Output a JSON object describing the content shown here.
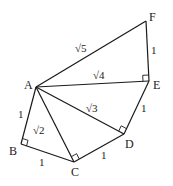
{
  "diagram": {
    "points": {
      "A": {
        "label": "A",
        "x": 36,
        "y": 87
      },
      "B": {
        "label": "B",
        "x": 21,
        "y": 144
      },
      "C": {
        "label": "C",
        "x": 74,
        "y": 162
      },
      "D": {
        "label": "D",
        "x": 124,
        "y": 134
      },
      "E": {
        "label": "E",
        "x": 149,
        "y": 81
      },
      "F": {
        "label": "F",
        "x": 146,
        "y": 21
      }
    },
    "segments": [
      {
        "from": "A",
        "to": "B",
        "length": "1"
      },
      {
        "from": "B",
        "to": "C",
        "length": "1"
      },
      {
        "from": "A",
        "to": "C",
        "length": "√2"
      },
      {
        "from": "C",
        "to": "D",
        "length": "1"
      },
      {
        "from": "A",
        "to": "D",
        "length": "√3"
      },
      {
        "from": "D",
        "to": "E",
        "length": "1"
      },
      {
        "from": "A",
        "to": "E",
        "length": "√4"
      },
      {
        "from": "E",
        "to": "F",
        "length": "1"
      },
      {
        "from": "A",
        "to": "F",
        "length": "√5"
      }
    ],
    "right_angles": [
      "B",
      "C",
      "D",
      "E"
    ],
    "labels": {
      "A": "A",
      "B": "B",
      "C": "C",
      "D": "D",
      "E": "E",
      "F": "F",
      "AB": "1",
      "BC": "1",
      "CD": "1",
      "DE": "1",
      "EF": "1",
      "AC": "√2",
      "AD": "√3",
      "AE": "√4",
      "AF": "√5"
    }
  }
}
